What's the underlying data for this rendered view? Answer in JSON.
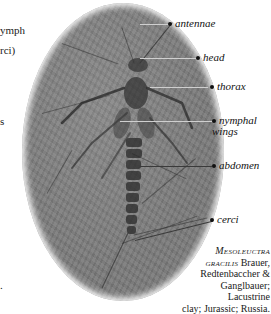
{
  "left_fragments": [
    {
      "text": "ymph",
      "top": 24
    },
    {
      "text": "rci)",
      "top": 44
    },
    {
      "text": "s",
      "top": 115
    },
    {
      "text": ".",
      "top": 279
    }
  ],
  "specimen": {
    "description": "fossil insect nymph on oval slab of grey lacustrine clay",
    "slab_color": "#7b7b7b"
  },
  "labels": [
    {
      "id": "antennae",
      "text": "antennae",
      "y": 23
    },
    {
      "id": "head",
      "text": "head",
      "y": 57
    },
    {
      "id": "thorax",
      "text": "thorax",
      "y": 86
    },
    {
      "id": "nymphal_wings_1",
      "text": "nymphal",
      "y": 120
    },
    {
      "id": "nymphal_wings_2",
      "text": "wings",
      "y": 131
    },
    {
      "id": "abdomen",
      "text": "abdomen",
      "y": 165
    },
    {
      "id": "cerci",
      "text": "cerci",
      "y": 219
    }
  ],
  "caption": {
    "genus": "Mesoleuctra",
    "species": "gracilis",
    "authors": "Brauer, Redtenbaccher & Ganglbauer;",
    "line_authors_1": " Brauer,",
    "line_authors_2": "Redtenbaccher &",
    "line_authors_3": "Ganglbauer; Lacustrine",
    "line_4": "clay; Jurassic; Russia."
  }
}
